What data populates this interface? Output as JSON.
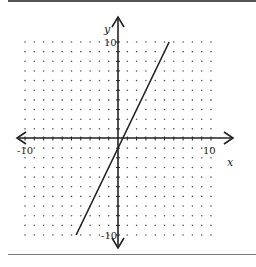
{
  "chart_data": {
    "type": "line",
    "title": "",
    "xlabel": "x",
    "ylabel": "y",
    "xlim": [
      -10,
      10
    ],
    "ylim": [
      -10,
      10
    ],
    "grid": "dots",
    "tick_labels": {
      "x_min": "-10",
      "x_max": "10",
      "y_min": "-10",
      "y_max": "10"
    },
    "series": [
      {
        "name": "line",
        "equation": "y = 2x - 1",
        "x": [
          -4.5,
          5.5
        ],
        "y": [
          -10,
          10
        ]
      }
    ]
  },
  "colors": {
    "line": "#222222",
    "dots": "#555555",
    "axes": "#222222"
  }
}
